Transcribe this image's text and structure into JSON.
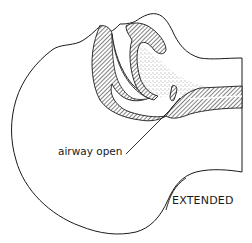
{
  "figure": {
    "annotations": {
      "airway": "airway open",
      "position": "EXTENDED"
    },
    "colors": {
      "ink": "#1a1a1a",
      "background": "#ffffff"
    }
  }
}
